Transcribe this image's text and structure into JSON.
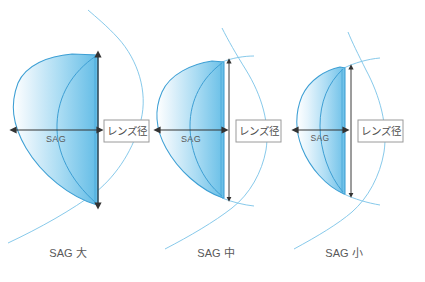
{
  "figure": {
    "title_present": false,
    "background_color": "#ffffff",
    "lens_fill_light": "#e8f4fb",
    "lens_fill_dark": "#6cc0e8",
    "lens_stroke_color": "#3d9fd4",
    "tangent_color": "#79c3e8",
    "dimension_line_color": "#333333",
    "label_box_border": "#9a9a9a",
    "text_color": "#5a5a5a"
  },
  "panels": [
    {
      "id": "panel-large",
      "sag_label": "SAG",
      "diameter_label": "レンズ径",
      "caption": "SAG  大",
      "caption_sag_word": "SAG",
      "caption_size_word": "大",
      "sag_relative_width": "large"
    },
    {
      "id": "panel-medium",
      "sag_label": "SAG",
      "diameter_label": "レンズ径",
      "caption": "SAG  中",
      "caption_sag_word": "SAG",
      "caption_size_word": "中",
      "sag_relative_width": "medium"
    },
    {
      "id": "panel-small",
      "sag_label": "SAG",
      "diameter_label": "レンズ径",
      "caption": "SAG  小",
      "caption_sag_word": "SAG",
      "caption_size_word": "小",
      "sag_relative_width": "small"
    }
  ]
}
